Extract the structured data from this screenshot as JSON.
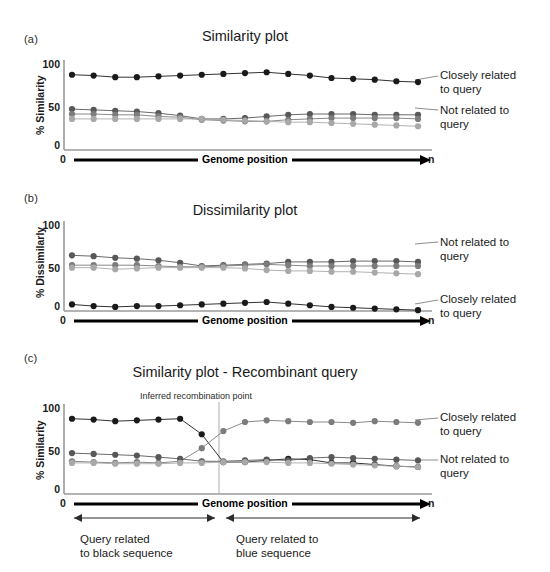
{
  "figure": {
    "width": 550,
    "height": 572,
    "background": "#ffffff"
  },
  "colors": {
    "black_series": "#1a1a1a",
    "dark_gray_series": "#585858",
    "mid_gray_series": "#7c7c7c",
    "light_gray_series": "#a8a8a8",
    "axis": "#9a9a9a",
    "connector": "#8d8d8d",
    "arrow_black": "#000000",
    "guide_line": "#b4b4b4"
  },
  "panels": [
    {
      "letter": "(a)",
      "title": "Similarity plot",
      "ylabel": "% Similarity",
      "yticks": [
        "100",
        "50",
        "0"
      ],
      "ylim": [
        0,
        110
      ],
      "xaxis": {
        "start_label": "0",
        "end_label": "n",
        "title": "Genome position"
      },
      "side_labels": [
        {
          "text_line1": "Closely related",
          "text_line2": "to query"
        },
        {
          "text_line1": "Not related to",
          "text_line2": "query"
        }
      ]
    },
    {
      "letter": "(b)",
      "title": "Dissimilarity plot",
      "ylabel": "% Dissimilarly",
      "yticks": [
        "100",
        "50",
        "0"
      ],
      "ylim": [
        0,
        110
      ],
      "xaxis": {
        "start_label": "0",
        "end_label": "n",
        "title": "Genome position"
      },
      "side_labels": [
        {
          "text_line1": "Not related to",
          "text_line2": "query"
        },
        {
          "text_line1": "Closely related",
          "text_line2": "to query"
        }
      ]
    },
    {
      "letter": "(c)",
      "title": "Similarity plot - Recombinant query",
      "ylabel": "% Similarity",
      "yticks": [
        "100",
        "50",
        "0"
      ],
      "ylim": [
        0,
        110
      ],
      "xaxis": {
        "start_label": "0",
        "end_label": "n",
        "title": "Genome position"
      },
      "annotation": "Inferred recombination point",
      "side_labels": [
        {
          "text_line1": "Closely related",
          "text_line2": "to query"
        },
        {
          "text_line1": "Not related to",
          "text_line2": "query"
        }
      ],
      "regions": [
        {
          "line1": "Query related",
          "line2": "to black sequence"
        },
        {
          "line1": "Query related to",
          "line2": "blue sequence"
        }
      ]
    }
  ],
  "chart_data": [
    {
      "type": "line",
      "panel": "(a)",
      "title": "Similarity plot",
      "xlabel": "Genome position",
      "ylabel": "% Similarity",
      "ylim": [
        0,
        110
      ],
      "yticks": [
        0,
        50,
        100
      ],
      "xtick_labels": [
        "0",
        "n"
      ],
      "grid": false,
      "legend_position": "right",
      "x": [
        1,
        2,
        3,
        4,
        5,
        6,
        7,
        8,
        9,
        10,
        11,
        12,
        13,
        14,
        15,
        16,
        17
      ],
      "series": [
        {
          "name": "Closely related to query",
          "color": "#1a1a1a",
          "values": [
            92,
            91,
            89,
            89,
            90,
            91,
            92,
            93,
            94,
            95,
            93,
            91,
            88,
            87,
            86,
            84,
            83
          ]
        },
        {
          "name": "Not related to query (dark gray)",
          "color": "#585858",
          "values": [
            50,
            49,
            48,
            47,
            45,
            42,
            38,
            38,
            39,
            41,
            43,
            44,
            44,
            44,
            43,
            43,
            43
          ]
        },
        {
          "name": "Not related to query (mid gray)",
          "color": "#7c7c7c",
          "values": [
            44,
            44,
            43,
            43,
            41,
            40,
            37,
            36,
            35,
            35,
            37,
            38,
            39,
            39,
            39,
            39,
            38
          ]
        },
        {
          "name": "Not related to query (light gray)",
          "color": "#a8a8a8",
          "values": [
            38,
            38,
            38,
            38,
            38,
            38,
            38,
            37,
            36,
            35,
            34,
            34,
            33,
            32,
            31,
            30,
            29
          ]
        }
      ]
    },
    {
      "type": "line",
      "panel": "(b)",
      "title": "Dissimilarity plot",
      "xlabel": "Genome position",
      "ylabel": "% Dissimilarly",
      "ylim": [
        0,
        110
      ],
      "yticks": [
        0,
        50,
        100
      ],
      "xtick_labels": [
        "0",
        "n"
      ],
      "grid": false,
      "legend_position": "right",
      "x": [
        1,
        2,
        3,
        4,
        5,
        6,
        7,
        8,
        9,
        10,
        11,
        12,
        13,
        14,
        15,
        16,
        17
      ],
      "series": [
        {
          "name": "Not related to query (dark gray)",
          "color": "#585858",
          "values": [
            68,
            67,
            65,
            64,
            62,
            59,
            55,
            56,
            57,
            58,
            60,
            60,
            60,
            61,
            61,
            61,
            60
          ]
        },
        {
          "name": "Not related to query (mid gray)",
          "color": "#7c7c7c",
          "values": [
            56,
            56,
            56,
            56,
            55,
            54,
            54,
            55,
            56,
            57,
            56,
            55,
            55,
            55,
            55,
            55,
            55
          ]
        },
        {
          "name": "Not related to query (light gray)",
          "color": "#a8a8a8",
          "values": [
            53,
            53,
            51,
            52,
            53,
            53,
            53,
            53,
            52,
            50,
            49,
            49,
            48,
            48,
            47,
            46,
            45
          ]
        },
        {
          "name": "Closely related to query",
          "color": "#1a1a1a",
          "values": [
            8,
            6,
            5,
            6,
            6,
            7,
            8,
            9,
            10,
            11,
            9,
            7,
            5,
            4,
            3,
            2,
            1
          ]
        }
      ]
    },
    {
      "type": "line",
      "panel": "(c)",
      "title": "Similarity plot - Recombinant query",
      "xlabel": "Genome position",
      "ylabel": "% Similarity",
      "ylim": [
        0,
        110
      ],
      "yticks": [
        0,
        50,
        100
      ],
      "xtick_labels": [
        "0",
        "n"
      ],
      "grid": false,
      "legend_position": "right",
      "recombination_point_x": 7.5,
      "annotation": "Inferred recombination point",
      "x": [
        1,
        2,
        3,
        4,
        5,
        6,
        7,
        8,
        9,
        10,
        11,
        12,
        13,
        14,
        15,
        16,
        17
      ],
      "series": [
        {
          "name": "Black sequence (closely related before recombination point)",
          "color": "#1a1a1a",
          "values": [
            92,
            91,
            89,
            90,
            91,
            92,
            73,
            39,
            39,
            41,
            43,
            42,
            38,
            38,
            36,
            34,
            33
          ]
        },
        {
          "name": "Blue/gray sequence (closely related after recombination point)",
          "color": "#7c7c7c",
          "values": [
            40,
            39,
            38,
            39,
            38,
            40,
            56,
            77,
            88,
            90,
            89,
            88,
            88,
            87,
            89,
            88,
            87
          ]
        },
        {
          "name": "Not related to query (dark gray)",
          "color": "#585858",
          "values": [
            50,
            49,
            48,
            47,
            45,
            43,
            40,
            40,
            41,
            42,
            41,
            44,
            45,
            44,
            43,
            42,
            41
          ]
        },
        {
          "name": "Not related to query (light gray)",
          "color": "#a8a8a8",
          "values": [
            38,
            38,
            37,
            37,
            37,
            38,
            38,
            39,
            39,
            39,
            38,
            38,
            37,
            36,
            35,
            34,
            33
          ]
        }
      ]
    }
  ]
}
